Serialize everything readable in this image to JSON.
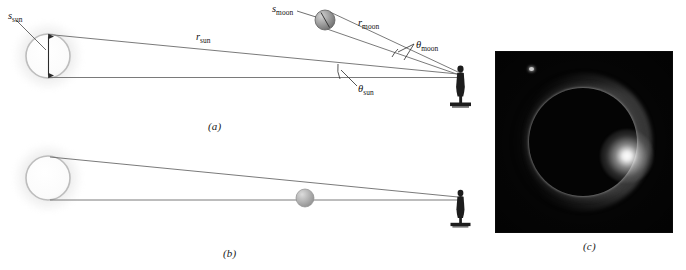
{
  "figure": {
    "panels": [
      {
        "id": "a",
        "label": "(a)",
        "caption_x": 208,
        "caption_y": 120
      },
      {
        "id": "b",
        "label": "(b)",
        "caption_x": 223,
        "caption_y": 247
      },
      {
        "id": "c",
        "label": "(c)",
        "caption_x": 583,
        "caption_y": 240
      }
    ]
  },
  "panel_a": {
    "labels": {
      "s_sun": {
        "sym": "s",
        "sub": "sun",
        "x": 8,
        "y": 11
      },
      "s_moon": {
        "sym": "s",
        "sub": "moon",
        "x": 272,
        "y": 4
      },
      "r_sun": {
        "sym": "r",
        "sub": "sun",
        "x": 196,
        "y": 32
      },
      "r_moon": {
        "sym": "r",
        "sub": "moon",
        "x": 358,
        "y": 18
      },
      "t_sun": {
        "sym": "θ",
        "sub": "sun",
        "x": 358,
        "y": 84
      },
      "t_moon": {
        "sym": "θ",
        "sub": "moon",
        "x": 416,
        "y": 40
      }
    },
    "sun": {
      "cx": 48,
      "cy": 56,
      "r": 22
    },
    "moon": {
      "cx": 325,
      "cy": 20,
      "r": 10
    },
    "observer": {
      "x": 460,
      "y": 66,
      "h": 38
    }
  },
  "panel_b": {
    "sun": {
      "cx": 48,
      "cy": 178,
      "r": 22
    },
    "moon": {
      "cx": 305,
      "cy": 198,
      "r": 9
    },
    "observer": {
      "x": 460,
      "y": 190,
      "h": 32
    }
  },
  "panel_c": {
    "description": "total solar eclipse photograph",
    "frame": {
      "x": 496,
      "y": 52,
      "w": 176,
      "h": 180
    },
    "moon_disk": {
      "cx": 87,
      "cy": 90,
      "r": 54
    },
    "diamond_ring": {
      "cx": 131,
      "cy": 104
    },
    "star": {
      "cx": 35,
      "cy": 17
    },
    "background_color": "#050505",
    "corona_color": "#ffffff"
  },
  "colors": {
    "line": "#6b6b6b",
    "ink": "#121212",
    "paper": "#ffffff",
    "sun_outline": "#b9b9b9",
    "moon_fill": "#9a9a9a",
    "observer": "#1c1c1c"
  }
}
